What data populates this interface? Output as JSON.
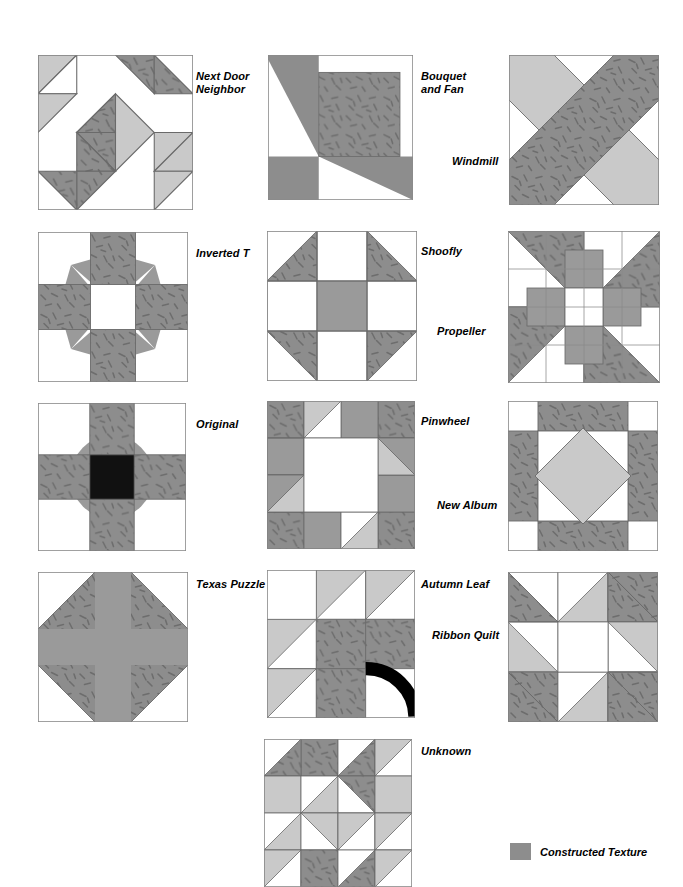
{
  "page": {
    "background": "#ffffff",
    "width": 683,
    "height": 881
  },
  "palette": {
    "dark_texture_fill": "#8d8d8d",
    "texture_stroke": "#6a6a6a",
    "light_gray": "#c9c9c9",
    "mid_gray": "#9a9a9a",
    "white": "#ffffff",
    "black": "#000000",
    "outline": "#7a7a7a"
  },
  "legend": {
    "label": "Constructed Texture",
    "swatch_color": "#8d8d8d"
  },
  "blocks": [
    {
      "id": "next-door-neighbor",
      "name": "Next Door Neighbor",
      "label": "Next Door\nNeighbor",
      "x": 38,
      "y": 55,
      "size": 155,
      "label_x": 196,
      "label_y": 70
    },
    {
      "id": "bouquet-and-fan",
      "name": "Bouquet and Fan",
      "label": "Bouquet\nand Fan",
      "x": 268,
      "y": 55,
      "size": 145,
      "label_x": 421,
      "label_y": 70
    },
    {
      "id": "windmill",
      "name": "Windmill",
      "label": "Windmill",
      "x": 509,
      "y": 55,
      "size": 150,
      "label_x": 452,
      "label_y": 155
    },
    {
      "id": "inverted-t",
      "name": "Inverted T",
      "label": "Inverted T",
      "x": 38,
      "y": 232,
      "size": 150,
      "label_x": 196,
      "label_y": 247
    },
    {
      "id": "shoofly",
      "name": "Shoofly",
      "label": "Shoofly",
      "x": 267,
      "y": 231,
      "size": 150,
      "label_x": 421,
      "label_y": 245
    },
    {
      "id": "propeller",
      "name": "Propeller",
      "label": "Propeller",
      "x": 508,
      "y": 231,
      "size": 152,
      "label_x": 437,
      "label_y": 325
    },
    {
      "id": "original",
      "name": "Original",
      "label": "Original",
      "x": 38,
      "y": 403,
      "size": 148,
      "label_x": 196,
      "label_y": 418
    },
    {
      "id": "pinwheel",
      "name": "Pinwheel",
      "label": "Pinwheel",
      "x": 267,
      "y": 401,
      "size": 148,
      "label_x": 421,
      "label_y": 415
    },
    {
      "id": "new-album",
      "name": "New Album",
      "label": "New Album",
      "x": 508,
      "y": 401,
      "size": 150,
      "label_x": 437,
      "label_y": 499
    },
    {
      "id": "texas-puzzle",
      "name": "Texas Puzzle",
      "label": "Texas Puzzle",
      "x": 38,
      "y": 572,
      "size": 150,
      "label_x": 196,
      "label_y": 578
    },
    {
      "id": "autumn-leaf",
      "name": "Autumn Leaf",
      "label": "Autumn Leaf",
      "x": 267,
      "y": 570,
      "size": 148,
      "label_x": 421,
      "label_y": 578
    },
    {
      "id": "ribbon-quilt",
      "name": "Ribbon Quilt",
      "label": "Ribbon Quilt",
      "x": 508,
      "y": 572,
      "size": 150,
      "label_x": 432,
      "label_y": 629
    },
    {
      "id": "unknown",
      "name": "Unknown",
      "label": "Unknown",
      "x": 264,
      "y": 739,
      "size": 148,
      "label_x": 421,
      "label_y": 745
    }
  ],
  "legend_position": {
    "x": 510,
    "y": 843
  }
}
